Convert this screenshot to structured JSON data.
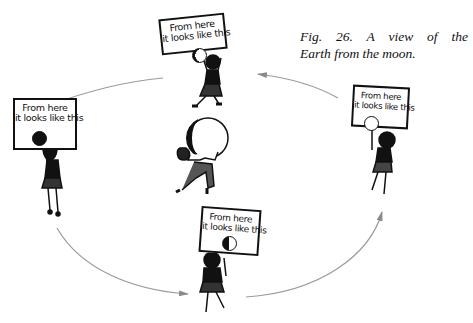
{
  "figure": {
    "caption_line1": "Fig. 26. A view of the",
    "caption_line2": "Earth from the moon.",
    "caption_full": "Fig. 26. A view of the Earth from the moon."
  },
  "center": {
    "description": "man carrying a half-shaded globe (Earth) on his back",
    "globe": "half-lit sphere"
  },
  "signs": [
    {
      "position": "top",
      "line1": "From here",
      "line2": "it looks like this",
      "phase": "full-with-dark-left-sliver"
    },
    {
      "position": "left",
      "line1": "From here",
      "line2": "it looks like this",
      "phase": "new (solid black)"
    },
    {
      "position": "right",
      "line1": "From here",
      "line2": "it looks like this",
      "phase": "full (empty circle)"
    },
    {
      "position": "bottom",
      "line1": "From here",
      "line2": "it looks like this",
      "phase": "half (left dark)"
    }
  ],
  "orbit": {
    "direction": "counter-clockwise",
    "arrow_color": "#9a9a9a",
    "arrows": [
      "top-right to top",
      "top to left",
      "left to bottom",
      "bottom to right"
    ]
  },
  "colors": {
    "ink": "#111111",
    "background": "#ffffff",
    "orbit": "#9a9a9a"
  }
}
